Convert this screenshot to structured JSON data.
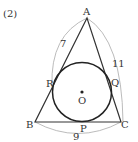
{
  "problem_label": "(2)",
  "points": {
    "A": "A",
    "B": "B",
    "C": "C",
    "P": "P",
    "Q": "Q",
    "R": "R",
    "O": "O"
  },
  "lengths": {
    "AB": "7",
    "AC": "11",
    "BC": "9"
  },
  "colors": {
    "line": "#333333",
    "arc": "#999999"
  }
}
